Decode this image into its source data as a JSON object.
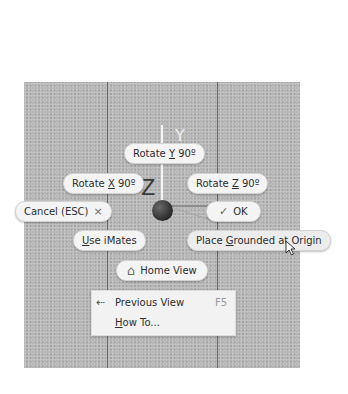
{
  "viewport": {
    "axes": {
      "y_label": "Y",
      "z_label": "Z"
    }
  },
  "marking_menu": {
    "rotate_y": {
      "prefix": "Rotate ",
      "key": "Y",
      "suffix": " 90º"
    },
    "rotate_x": {
      "prefix": "Rotate ",
      "key": "X",
      "suffix": " 90º"
    },
    "rotate_z": {
      "prefix": "Rotate ",
      "key": "Z",
      "suffix": " 90º"
    },
    "cancel": {
      "label": "Cancel (ESC)",
      "icon": "×"
    },
    "ok": {
      "label": "OK",
      "icon": "✓"
    },
    "use_imates": {
      "key": "U",
      "rest": "se iMates"
    },
    "place_grounded": {
      "prefix": "Place ",
      "key": "G",
      "rest": "rounded at Origin"
    },
    "home_view": {
      "label": "Home View",
      "icon": "⌂"
    }
  },
  "overflow_menu": {
    "items": [
      {
        "label": "Previous View",
        "shortcut": "F5",
        "icon": "⇠"
      },
      {
        "key": "H",
        "rest": "ow To..."
      }
    ]
  }
}
